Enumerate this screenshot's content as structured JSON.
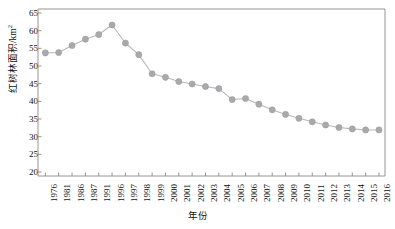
{
  "chart_data": {
    "type": "line",
    "title": "",
    "xlabel": "年份",
    "ylabel": "红树林面积/km²",
    "ylabel_text": "红树林面积/km",
    "ylabel_sup": "2",
    "ylim": [
      20,
      65
    ],
    "yticks": [
      20,
      25,
      30,
      35,
      40,
      45,
      50,
      55,
      60,
      65
    ],
    "grid": false,
    "legend": null,
    "marker": "circle",
    "series_color": "#a9a9ad",
    "line_color": "#b8b8bc",
    "axis_color": "#8a8a8a",
    "categories": [
      "1976",
      "1981",
      "1986",
      "1987",
      "1991",
      "1996",
      "1997",
      "1998",
      "1999",
      "2000",
      "2001",
      "2002",
      "2003",
      "2004",
      "2005",
      "2006",
      "2007",
      "2008",
      "2009",
      "2010",
      "2011",
      "2012",
      "2013",
      "2014",
      "2015",
      "2016"
    ],
    "values": [
      53.7,
      53.8,
      55.8,
      57.6,
      58.9,
      61.6,
      56.5,
      53.2,
      47.8,
      46.8,
      45.6,
      44.9,
      44.2,
      43.6,
      40.5,
      40.8,
      39.2,
      37.6,
      36.3,
      35.2,
      34.2,
      33.3,
      32.6,
      32.2,
      31.9,
      31.9
    ]
  }
}
